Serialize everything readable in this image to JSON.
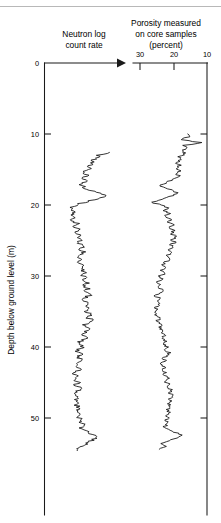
{
  "figure": {
    "depth_axis": {
      "label": "Depth below ground level (m)",
      "ticks": [
        0,
        10,
        20,
        30,
        40,
        50
      ]
    },
    "panels": {
      "neutron": {
        "title_line1": "Neutron log",
        "title_line2": "count rate",
        "arrow_direction": "right"
      },
      "porosity": {
        "title_line1": "Porosity measured",
        "title_line2": "on core samples",
        "title_line3": "(percent)",
        "ticks": [
          30,
          20,
          10
        ]
      }
    }
  },
  "chart_data": {
    "type": "line",
    "orientation": "vertical",
    "grid": false,
    "legend": null,
    "ylabel": "Depth below ground level (m)",
    "ylim": [
      0,
      57
    ],
    "y_ticks": [
      0,
      10,
      20,
      30,
      40,
      50
    ],
    "y_inverted": true,
    "panels": [
      {
        "name": "neutron-log",
        "xlabel": "Neutron log count rate",
        "x_scale": "arbitrary (increases to the right)",
        "x_ticks": [],
        "x_inverted": false,
        "depths": [
          12.6,
          13.0,
          13.4,
          13.8,
          14.2,
          14.6,
          15.0,
          15.4,
          15.8,
          16.2,
          16.6,
          17.0,
          17.4,
          17.8,
          18.2,
          18.6,
          19.0,
          19.4,
          19.8,
          20.2,
          20.6,
          21.0,
          21.4,
          21.8,
          22.2,
          22.6,
          23.0,
          23.4,
          23.8,
          24.2,
          24.6,
          25.0,
          25.4,
          25.8,
          26.2,
          26.6,
          27.0,
          27.4,
          27.8,
          28.2,
          28.6,
          29.0,
          29.4,
          29.8,
          30.2,
          30.6,
          31.0,
          31.4,
          31.8,
          32.2,
          32.6,
          33.0,
          33.4,
          33.8,
          34.2,
          34.6,
          35.0,
          35.4,
          35.8,
          36.2,
          36.6,
          37.0,
          37.4,
          37.8,
          38.2,
          38.6,
          39.0,
          39.4,
          39.8,
          40.2,
          40.6,
          41.0,
          41.4,
          41.8,
          42.2,
          42.6,
          43.0,
          43.4,
          43.8,
          44.2,
          44.6,
          45.0,
          45.4,
          45.8,
          46.2,
          46.6,
          47.0,
          47.4,
          47.8,
          48.2,
          48.6,
          49.0,
          49.4,
          49.8,
          50.2,
          50.6,
          51.0,
          51.4,
          51.8,
          52.2,
          52.6,
          53.0,
          53.4,
          53.8,
          54.2,
          54.6,
          55.0,
          55.4
        ],
        "values": [
          0.95,
          0.74,
          0.7,
          0.62,
          0.66,
          0.56,
          0.6,
          0.52,
          0.58,
          0.49,
          0.55,
          0.47,
          0.52,
          0.58,
          0.7,
          0.86,
          0.76,
          0.6,
          0.44,
          0.36,
          0.3,
          0.38,
          0.3,
          0.4,
          0.32,
          0.42,
          0.34,
          0.44,
          0.36,
          0.46,
          0.4,
          0.48,
          0.42,
          0.5,
          0.44,
          0.52,
          0.46,
          0.4,
          0.48,
          0.42,
          0.5,
          0.46,
          0.54,
          0.48,
          0.56,
          0.5,
          0.58,
          0.52,
          0.6,
          0.54,
          0.62,
          0.56,
          0.5,
          0.58,
          0.52,
          0.6,
          0.54,
          0.62,
          0.56,
          0.64,
          0.58,
          0.52,
          0.6,
          0.54,
          0.48,
          0.56,
          0.5,
          0.44,
          0.52,
          0.46,
          0.4,
          0.48,
          0.42,
          0.5,
          0.44,
          0.38,
          0.46,
          0.4,
          0.34,
          0.42,
          0.36,
          0.44,
          0.38,
          0.46,
          0.4,
          0.34,
          0.42,
          0.36,
          0.44,
          0.38,
          0.46,
          0.4,
          0.48,
          0.42,
          0.5,
          0.44,
          0.52,
          0.46,
          0.54,
          0.6,
          0.72,
          0.66,
          0.58,
          0.5,
          0.44,
          0.38
        ]
      },
      {
        "name": "core-porosity",
        "xlabel": "Porosity measured on core samples (percent)",
        "x_ticks": [
          30,
          20,
          10
        ],
        "x_inverted": true,
        "xlim": [
          30,
          10
        ],
        "depths": [
          10.0,
          10.4,
          10.8,
          11.2,
          11.6,
          12.0,
          12.4,
          12.8,
          13.2,
          13.6,
          14.0,
          14.4,
          14.8,
          15.2,
          15.6,
          16.0,
          16.4,
          16.8,
          17.2,
          17.6,
          18.0,
          18.4,
          18.8,
          19.2,
          19.6,
          20.0,
          20.4,
          20.8,
          21.2,
          21.6,
          22.0,
          22.4,
          22.8,
          23.2,
          23.6,
          24.0,
          24.4,
          24.8,
          25.2,
          25.6,
          26.0,
          26.4,
          26.8,
          27.2,
          27.6,
          28.0,
          28.4,
          28.8,
          29.2,
          29.6,
          30.0,
          30.4,
          30.8,
          31.2,
          31.6,
          32.0,
          32.4,
          32.8,
          33.2,
          33.6,
          34.0,
          34.4,
          34.8,
          35.2,
          35.6,
          36.0,
          36.4,
          36.8,
          37.2,
          37.6,
          38.0,
          38.4,
          38.8,
          39.2,
          39.6,
          40.0,
          40.4,
          40.8,
          41.2,
          41.6,
          42.0,
          42.4,
          42.8,
          43.2,
          43.6,
          44.0,
          44.4,
          44.8,
          45.2,
          45.6,
          46.0,
          46.4,
          46.8,
          47.2,
          47.6,
          48.0,
          48.4,
          48.8,
          49.2,
          49.6,
          50.0,
          50.4,
          50.8,
          51.2,
          51.6,
          52.0,
          52.4,
          52.8,
          53.2,
          53.6,
          54.0,
          54.4,
          54.8
        ],
        "values": [
          16.0,
          15.5,
          18.0,
          11.5,
          17.0,
          16.5,
          17.2,
          16.8,
          18.5,
          17.5,
          19.5,
          18.0,
          19.0,
          17.8,
          19.2,
          18.2,
          20.5,
          22.0,
          24.0,
          22.5,
          20.0,
          18.5,
          21.0,
          23.5,
          26.5,
          24.0,
          21.5,
          23.0,
          21.0,
          22.5,
          20.5,
          22.0,
          20.0,
          21.5,
          19.5,
          21.0,
          19.0,
          20.5,
          19.5,
          21.0,
          20.0,
          21.5,
          20.5,
          22.0,
          21.0,
          22.5,
          23.5,
          22.0,
          24.0,
          22.5,
          24.5,
          23.0,
          25.0,
          23.5,
          24.5,
          23.0,
          24.0,
          25.5,
          24.0,
          25.0,
          24.5,
          25.5,
          24.8,
          25.8,
          25.0,
          24.0,
          25.0,
          23.5,
          24.5,
          23.0,
          24.0,
          22.5,
          23.5,
          22.0,
          23.0,
          21.5,
          22.5,
          21.0,
          22.0,
          23.5,
          22.0,
          24.0,
          22.5,
          23.5,
          22.0,
          23.0,
          21.5,
          22.5,
          21.0,
          22.0,
          20.5,
          21.5,
          20.0,
          21.0,
          20.5,
          21.5,
          20.8,
          21.8,
          21.0,
          22.0,
          21.5,
          22.5,
          21.8,
          22.8,
          21.5,
          20.0,
          17.5,
          19.0,
          21.0,
          23.5,
          22.0,
          24.5
        ]
      }
    ]
  }
}
